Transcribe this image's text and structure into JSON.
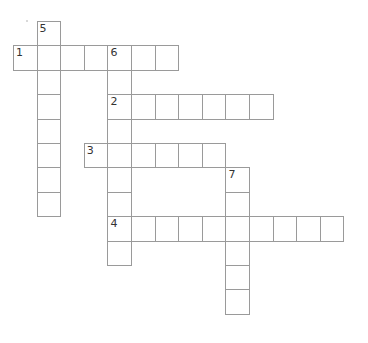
{
  "puzzle": {
    "type": "crossword",
    "cell_width": 23.6,
    "cell_height": 24.4,
    "origin_x": 13,
    "origin_y": 21,
    "border_color": "#9a9a9a",
    "entries": [
      {
        "number": "1",
        "direction": "across",
        "row": 1,
        "col": 0,
        "length": 7
      },
      {
        "number": "2",
        "direction": "across",
        "row": 3,
        "col": 4,
        "length": 7
      },
      {
        "number": "3",
        "direction": "across",
        "row": 5,
        "col": 3,
        "length": 6
      },
      {
        "number": "4",
        "direction": "across",
        "row": 8,
        "col": 4,
        "length": 10
      },
      {
        "number": "5",
        "direction": "down",
        "row": 0,
        "col": 1,
        "length": 8
      },
      {
        "number": "6",
        "direction": "down",
        "row": 1,
        "col": 4,
        "length": 9
      },
      {
        "number": "7",
        "direction": "down",
        "row": 6,
        "col": 9,
        "length": 6
      }
    ]
  }
}
